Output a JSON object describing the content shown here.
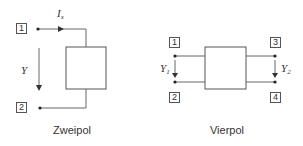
{
  "zweipol": {
    "caption": "Zweipol",
    "terminals": [
      {
        "id": "1",
        "label": "1"
      },
      {
        "id": "2",
        "label": "2"
      }
    ],
    "current_label": {
      "base": "I",
      "sub": "x"
    },
    "admittance_label": {
      "base": "Y",
      "sub": ""
    }
  },
  "vierpol": {
    "caption": "Vierpol",
    "terminals": [
      {
        "id": "1",
        "label": "1"
      },
      {
        "id": "2",
        "label": "2"
      },
      {
        "id": "3",
        "label": "3"
      },
      {
        "id": "4",
        "label": "4"
      }
    ],
    "input_admittance_label": {
      "base": "Y",
      "sub": "1"
    },
    "output_admittance_label": {
      "base": "Y",
      "sub": "2"
    }
  },
  "colors": {
    "line": "#555555",
    "text": "#333333",
    "background": "#ffffff"
  }
}
